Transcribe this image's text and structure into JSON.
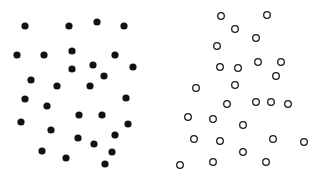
{
  "diagram": {
    "panels": [
      {
        "name": "filled-dots-panel",
        "style": "filled",
        "color": "#111111",
        "radius": 3.6,
        "points": [
          [
            25,
            26
          ],
          [
            69,
            26
          ],
          [
            97,
            22
          ],
          [
            124,
            26
          ],
          [
            17,
            55
          ],
          [
            44,
            55
          ],
          [
            72,
            51
          ],
          [
            115,
            55
          ],
          [
            93,
            65
          ],
          [
            133,
            67
          ],
          [
            72,
            69
          ],
          [
            104,
            76
          ],
          [
            31,
            80
          ],
          [
            57,
            86
          ],
          [
            90,
            86
          ],
          [
            25,
            99
          ],
          [
            126,
            98
          ],
          [
            47,
            106
          ],
          [
            79,
            115
          ],
          [
            102,
            115
          ],
          [
            21,
            122
          ],
          [
            128,
            124
          ],
          [
            51,
            130
          ],
          [
            115,
            135
          ],
          [
            78,
            138
          ],
          [
            94,
            144
          ],
          [
            42,
            151
          ],
          [
            112,
            152
          ],
          [
            66,
            158
          ],
          [
            105,
            164
          ]
        ]
      },
      {
        "name": "hollow-circles-panel",
        "style": "hollow",
        "color": "#1a1a1a",
        "radius": 3.3,
        "stroke_width": 1.3,
        "points": [
          [
            221,
            16
          ],
          [
            267,
            15
          ],
          [
            235,
            29
          ],
          [
            256,
            38
          ],
          [
            217,
            46
          ],
          [
            220,
            67
          ],
          [
            238,
            68
          ],
          [
            258,
            62
          ],
          [
            281,
            62
          ],
          [
            276,
            76
          ],
          [
            196,
            88
          ],
          [
            235,
            85
          ],
          [
            227,
            104
          ],
          [
            256,
            102
          ],
          [
            271,
            102
          ],
          [
            288,
            104
          ],
          [
            188,
            117
          ],
          [
            213,
            119
          ],
          [
            243,
            125
          ],
          [
            194,
            139
          ],
          [
            220,
            141
          ],
          [
            273,
            139
          ],
          [
            304,
            142
          ],
          [
            243,
            152
          ],
          [
            180,
            165
          ],
          [
            213,
            162
          ],
          [
            266,
            162
          ]
        ]
      }
    ]
  }
}
